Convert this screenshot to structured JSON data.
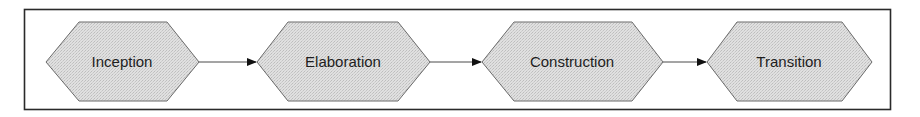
{
  "diagram": {
    "type": "process-flow",
    "colors": {
      "frame_stroke": "#2a2a2a",
      "shape_fill": "#dadada",
      "shape_stroke": "#6a6a6a",
      "connector": "#4a4a4a",
      "arrowhead": "#111111",
      "text": "#1e1e1e"
    },
    "phases": [
      {
        "label": "Inception"
      },
      {
        "label": "Elaboration"
      },
      {
        "label": "Construction"
      },
      {
        "label": "Transition"
      }
    ],
    "connectors": [
      {
        "from": "Inception",
        "to": "Elaboration"
      },
      {
        "from": "Elaboration",
        "to": "Construction"
      },
      {
        "from": "Construction",
        "to": "Transition"
      }
    ]
  }
}
